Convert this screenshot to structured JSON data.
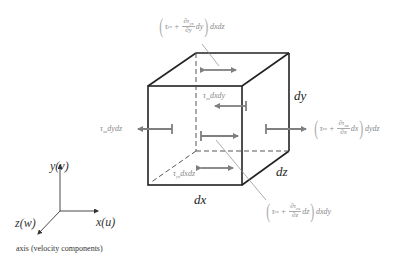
{
  "diagram": {
    "dimensions": {
      "dx": "dx",
      "dy": "dy",
      "dz": "dz"
    },
    "labels": {
      "top_face": {
        "tau": "τ",
        "sub": "yx",
        "plus": "+",
        "partial_num": "∂τ",
        "partial_num_sub": "yx",
        "partial_den": "∂y",
        "diff": "dy",
        "area": "dxdz"
      },
      "right_face": {
        "tau": "τ",
        "sub": "xx",
        "plus": "+",
        "partial_num": "∂τ",
        "partial_num_sub": "xx",
        "partial_den": "∂x",
        "diff": "dx",
        "area": "dydz"
      },
      "front_face": {
        "tau": "τ",
        "sub": "zx",
        "plus": "+",
        "partial_num": "∂τ",
        "partial_num_sub": "zx",
        "partial_den": "∂z",
        "diff": "dz",
        "area": "dxdy"
      },
      "back_face": {
        "tau": "τ",
        "sub": "zx",
        "area": "dxdy"
      },
      "left_face": {
        "tau": "τ",
        "sub": "xx",
        "area": "dydz"
      },
      "bottom_face": {
        "tau": "τ",
        "sub": "yx",
        "area": "dxdz"
      }
    },
    "axes": {
      "y": "y(v)",
      "x": "x(u)",
      "z": "z(w)",
      "caption": "axis (velocity components)"
    },
    "colors": {
      "edge": "#222222",
      "arrow": "#7f7f7f",
      "leader": "#8a8a8a",
      "text": "#8a8a8a"
    }
  }
}
